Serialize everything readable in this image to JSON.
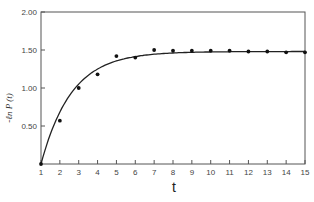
{
  "chart_data": {
    "type": "scatter",
    "title": "",
    "xlabel": "t",
    "ylabel": "-ℓn  P (t)",
    "xlim": [
      1,
      15
    ],
    "ylim": [
      0,
      2.0
    ],
    "x_ticks": [
      "1",
      "2",
      "3",
      "4",
      "5",
      "6",
      "7",
      "8",
      "9",
      "10",
      "11",
      "12",
      "13",
      "14",
      "15"
    ],
    "y_ticks": [
      "0.50",
      "1.00",
      "1.50",
      "2.00"
    ],
    "grid": false,
    "legend": null,
    "series": [
      {
        "name": "observed",
        "marker": "dot",
        "x": [
          1,
          2,
          3,
          4,
          5,
          6,
          7,
          8,
          9,
          10,
          11,
          12,
          13,
          14,
          15
        ],
        "values": [
          0.0,
          0.57,
          1.0,
          1.18,
          1.42,
          1.4,
          1.5,
          1.49,
          1.49,
          1.49,
          1.49,
          1.48,
          1.48,
          1.47,
          1.47
        ]
      },
      {
        "name": "fitted curve",
        "marker": "line",
        "description": "saturating curve rising from 0 at t=1 to plateau ~1.48 by t=7"
      }
    ]
  }
}
